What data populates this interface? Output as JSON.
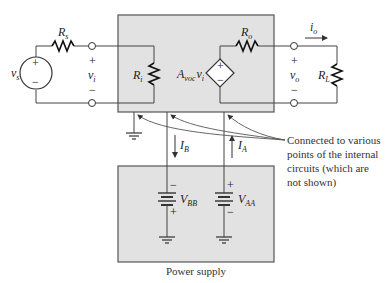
{
  "diagram": {
    "type": "amplifier-model-with-power-supplies",
    "colors": {
      "box_fill": "#e2e2e2",
      "box_border": "#555555",
      "wire": "#444444",
      "background": "#ffffff"
    },
    "input_side": {
      "source_label": "v",
      "source_sub": "s",
      "source_resistor": "R",
      "source_resistor_sub": "s",
      "input_voltage": "v",
      "input_voltage_sub": "i",
      "plus": "+",
      "minus": "−"
    },
    "amplifier": {
      "input_resistor": "R",
      "input_resistor_sub": "i",
      "gain_label": "A",
      "gain_sub": "voc",
      "gain_var": "v",
      "gain_var_sub": "i",
      "output_resistor": "R",
      "output_resistor_sub": "o",
      "dep_plus": "+",
      "dep_minus": "−"
    },
    "output_side": {
      "output_current": "i",
      "output_current_sub": "o",
      "output_voltage": "v",
      "output_voltage_sub": "o",
      "load_resistor": "R",
      "load_resistor_sub": "L",
      "plus": "+",
      "minus": "−"
    },
    "supply_currents": {
      "ib": "I",
      "ib_sub": "B",
      "ia": "I",
      "ia_sub": "A"
    },
    "power_supply": {
      "title": "Power supply",
      "vbb": "V",
      "vbb_sub": "BB",
      "vaa": "V",
      "vaa_sub": "AA",
      "vbb_top": "−",
      "vbb_bottom": "+",
      "vaa_top": "+",
      "vaa_bottom": "−"
    },
    "annotation": {
      "line1": "Connected to various",
      "line2": "points of the internal",
      "line3": "circuits (which are",
      "line4": "not shown)"
    }
  }
}
